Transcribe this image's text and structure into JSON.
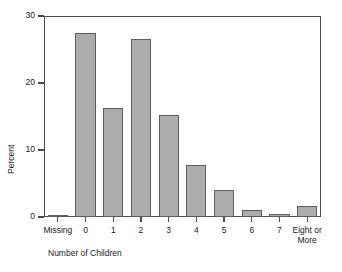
{
  "chart_data": {
    "type": "bar",
    "title": "",
    "subtitle": "",
    "xlabel": "Number of Children",
    "ylabel": "Percent",
    "categories": [
      "Missing",
      "0",
      "1",
      "2",
      "3",
      "4",
      "5",
      "6",
      "7",
      "Eight or\nMore"
    ],
    "values": [
      0.3,
      27.5,
      16.2,
      26.5,
      15.2,
      7.8,
      4.0,
      1.1,
      0.5,
      1.6
    ],
    "ylim": [
      0,
      30
    ],
    "xlim": [
      0,
      10
    ],
    "yticks": [
      0,
      10,
      20,
      30
    ],
    "ytick_labels": [
      "0",
      "10",
      "20",
      "30"
    ],
    "grid": false,
    "legend": null,
    "legend_position": "none",
    "bar_fill_color": "#acacac",
    "bar_edge_color": "#5d5d5d",
    "axis_color": "#4a4a4a",
    "text_color": "#1a1a1a",
    "background_color": "#ffffff",
    "annotations": []
  }
}
